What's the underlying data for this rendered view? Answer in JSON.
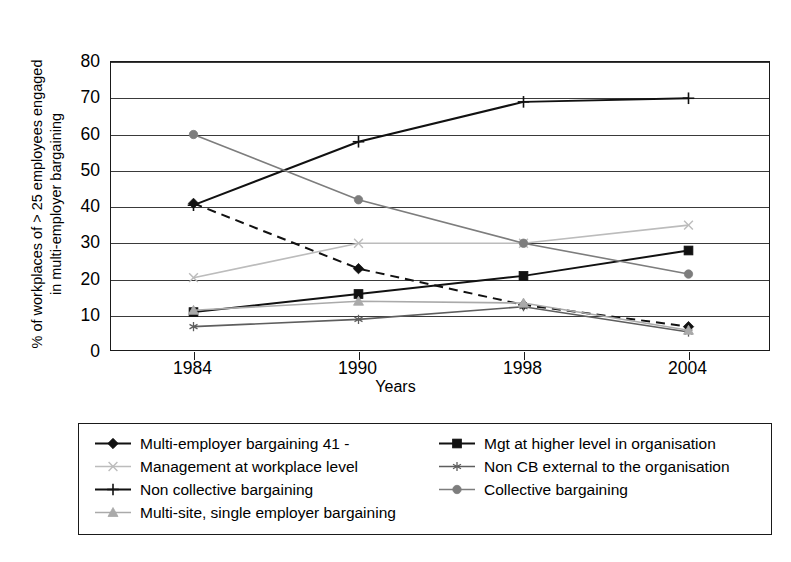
{
  "chart_data": {
    "type": "line",
    "title": "",
    "xlabel": "Years",
    "ylabel": "% of workplaces of > 25 employees engaged\nin multi-employer bargaining",
    "categories": [
      "1984",
      "1990",
      "1998",
      "2004"
    ],
    "x": [
      1984,
      1990,
      1998,
      2004
    ],
    "ylim": [
      0,
      80
    ],
    "yticks": [
      0,
      10,
      20,
      30,
      40,
      50,
      60,
      70,
      80
    ],
    "grid": true,
    "legend_position": "bottom",
    "series": [
      {
        "name": "Multi-employer bargaining 41 -",
        "values": [
          41,
          23,
          13,
          7
        ],
        "marker": "diamond",
        "line_style": "dashed",
        "color": "#111111"
      },
      {
        "name": "Mgt at higher level in organisation",
        "values": [
          11,
          16,
          21,
          28
        ],
        "marker": "square",
        "line_style": "solid",
        "color": "#111111"
      },
      {
        "name": "Management at workplace level",
        "values": [
          20.5,
          30,
          30,
          35
        ],
        "marker": "x",
        "line_style": "solid",
        "color": "#bcbcbc"
      },
      {
        "name": "Non CB external to the organisation",
        "values": [
          7,
          9,
          12.5,
          5.5
        ],
        "marker": "asterisk",
        "line_style": "solid",
        "color": "#5e5e5e"
      },
      {
        "name": "Non collective bargaining",
        "values": [
          40.5,
          58,
          69,
          70
        ],
        "marker": "plus",
        "line_style": "solid",
        "color": "#111111"
      },
      {
        "name": "Collective bargaining",
        "values": [
          60,
          42,
          30,
          21.5
        ],
        "marker": "circle",
        "line_style": "solid",
        "color": "#7d7d7d"
      },
      {
        "name": "Multi-site, single employer bargaining",
        "values": [
          11.5,
          14,
          13.5,
          6
        ],
        "marker": "triangle",
        "line_style": "solid",
        "color": "#aaaaaa"
      }
    ]
  },
  "axis": {
    "y_tick_labels": [
      "80",
      "70",
      "60",
      "50",
      "40",
      "30",
      "20",
      "10",
      "0"
    ],
    "x_tick_labels": [
      "1984",
      "1990",
      "1998",
      "2004"
    ],
    "x_title": "Years",
    "y_title": "% of workplaces of > 25 employees engaged\nin multi-employer bargaining"
  },
  "legend": {
    "left_column": [
      "Multi-employer bargaining 41 -",
      "Management at workplace level",
      "Non collective bargaining",
      "Multi-site, single employer bargaining"
    ],
    "right_column": [
      "Mgt at higher level in organisation",
      "Non CB external to the organisation",
      "Collective bargaining"
    ]
  }
}
